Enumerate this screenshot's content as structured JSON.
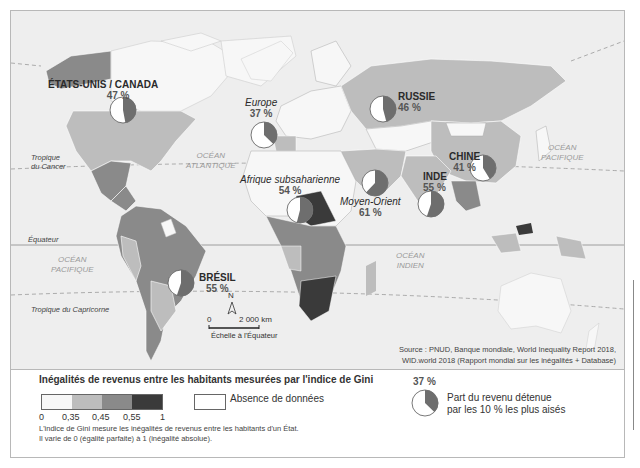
{
  "map": {
    "oceans": {
      "atlantique": [
        "OCÉAN",
        "ATLANTIQUE"
      ],
      "pacifique_east": [
        "OCÉAN",
        "PACIFIQUE"
      ],
      "pacifique_west": [
        "OCÉAN",
        "PACIFIQUE"
      ],
      "indien": [
        "OCÉAN",
        "INDIEN"
      ]
    },
    "lines": {
      "cancer": [
        "Tropique",
        "du Cancer"
      ],
      "equateur": "Équateur",
      "capricorne": "Tropique du Capricorne"
    },
    "regions": [
      {
        "name": "ÉTATS-UNIS / CANADA",
        "value": "47 %",
        "share": 47,
        "italic": false
      },
      {
        "name": "Europe",
        "value": "37 %",
        "share": 37,
        "italic": true
      },
      {
        "name": "RUSSIE",
        "value": "46 %",
        "share": 46,
        "italic": false
      },
      {
        "name": "CHINE",
        "value": "41 %",
        "share": 41,
        "italic": false
      },
      {
        "name": "INDE",
        "value": "55 %",
        "share": 55,
        "italic": false
      },
      {
        "name": "Afrique subsaharienne",
        "value": "54 %",
        "share": 54,
        "italic": true
      },
      {
        "name": "Moyen-Orient",
        "value": "61 %",
        "share": 61,
        "italic": true
      },
      {
        "name": "BRÉSIL",
        "value": "55 %",
        "share": 55,
        "italic": false
      }
    ],
    "compass": "N",
    "scale": {
      "zero": "0",
      "distance": "2 000 km",
      "note": "Échelle à l'Équateur"
    },
    "source": [
      "Source : PNUD, Banque mondiale, World Inequality Report 2018,",
      "WID.world 2018 (Rapport mondial sur les inégalités + Database)"
    ]
  },
  "legend": {
    "title": "Inégalités de revenus entre les habitants mesurées par l'indice de Gini",
    "classes": [
      {
        "range": "0 – 0,35",
        "color": "#f7f7f7"
      },
      {
        "range": "0,35 – 0,45",
        "color": "#bdbdbd"
      },
      {
        "range": "0,45 – 0,55",
        "color": "#8a8a8a"
      },
      {
        "range": "0,55 – 1",
        "color": "#3a3a3a"
      }
    ],
    "ticks": [
      "0",
      "0,35",
      "0,45",
      "0,55",
      "1"
    ],
    "no_data": "Absence de données",
    "note": [
      "L'indice de Gini mesure les inégalités de revenus entre les habitants d'un État.",
      "Il varie de 0 (égalité parfaite) à 1 (inégalité absolue)."
    ],
    "pie_example_value": "37 %",
    "pie_example_share": 37,
    "pie_caption": [
      "Part du revenu détenue",
      "par les 10 % les plus aisés"
    ]
  },
  "colors": {
    "ocean": "#eeeeee",
    "low": "#f7f7f7",
    "mid_low": "#bdbdbd",
    "mid_high": "#8a8a8a",
    "high": "#3a3a3a",
    "pie_fill": "#6e6e6e"
  }
}
